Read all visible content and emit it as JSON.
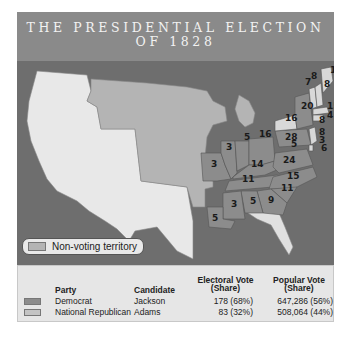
{
  "title": {
    "line1": "THE PRESIDENTIAL ELECTION",
    "line2": "OF 1828"
  },
  "map": {
    "non_voting_label": "Non-voting territory",
    "colors": {
      "democrat": "#8c8c8c",
      "national_republican": "#d8d8d8",
      "non_voting": "#b4b4b4",
      "unorganized_foreign": "#e8e8e8",
      "water": "#6e6e6e"
    },
    "state_labels": [
      {
        "state": "Maine",
        "votes": "1"
      },
      {
        "state": "Maine",
        "votes": "8"
      },
      {
        "state": "New Hampshire",
        "votes": "8"
      },
      {
        "state": "Vermont",
        "votes": "7"
      },
      {
        "state": "New York (Democrat)",
        "votes": "20"
      },
      {
        "state": "New York (National Republican)",
        "votes": "16"
      },
      {
        "state": "Massachusetts",
        "votes": "15"
      },
      {
        "state": "Rhode Island",
        "votes": "4"
      },
      {
        "state": "Connecticut",
        "votes": "8"
      },
      {
        "state": "New Jersey",
        "votes": "8"
      },
      {
        "state": "Delaware",
        "votes": "3"
      },
      {
        "state": "Maryland (National Republican)",
        "votes": "6"
      },
      {
        "state": "Maryland (Democrat)",
        "votes": "5"
      },
      {
        "state": "Pennsylvania",
        "votes": "28"
      },
      {
        "state": "Ohio",
        "votes": "16"
      },
      {
        "state": "Indiana",
        "votes": "5"
      },
      {
        "state": "Illinois",
        "votes": "3"
      },
      {
        "state": "Missouri",
        "votes": "3"
      },
      {
        "state": "Kentucky",
        "votes": "14"
      },
      {
        "state": "Virginia",
        "votes": "24"
      },
      {
        "state": "Tennessee",
        "votes": "11"
      },
      {
        "state": "North Carolina",
        "votes": "15"
      },
      {
        "state": "South Carolina",
        "votes": "11"
      },
      {
        "state": "Georgia",
        "votes": "9"
      },
      {
        "state": "Alabama",
        "votes": "5"
      },
      {
        "state": "Mississippi",
        "votes": "3"
      },
      {
        "state": "Louisiana",
        "votes": "5"
      }
    ]
  },
  "legend": {
    "headers": {
      "party": "Party",
      "candidate": "Candidate",
      "electoral_1": "Electoral Vote",
      "electoral_2": "(Share)",
      "popular_1": "Popular Vote",
      "popular_2": "(Share)"
    },
    "rows": [
      {
        "party": "Democrat",
        "candidate": "Jackson",
        "electoral": "178 (68%)",
        "popular": "647,286 (56%)",
        "color": "#8c8c8c"
      },
      {
        "party": "National Republican",
        "candidate": "Adams",
        "electoral": "83 (32%)",
        "popular": "508,064 (44%)",
        "color": "#c4c4c4"
      }
    ]
  }
}
